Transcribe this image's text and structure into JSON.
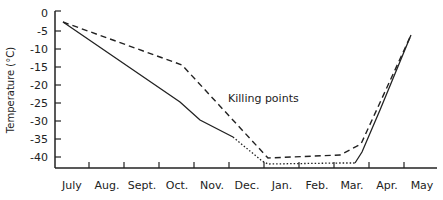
{
  "chart_data": {
    "type": "line",
    "title": "",
    "xlabel": "",
    "ylabel": "Temperature (°C)",
    "ylim": [
      -44,
      0
    ],
    "yticks": [
      0,
      -5,
      -10,
      -15,
      -20,
      -25,
      -30,
      -35,
      -40
    ],
    "categories": [
      "July",
      "Aug.",
      "Sept.",
      "Oct.",
      "Nov.",
      "Dec.",
      "Jan.",
      "Feb.",
      "Mar.",
      "Apr.",
      "May"
    ],
    "annotations": [
      {
        "text": "Killing points",
        "x": "Dec.",
        "y": -23
      }
    ],
    "grid": false,
    "legend": null,
    "series": [
      {
        "name": "Killing points",
        "style": "dashed",
        "points": [
          {
            "x": "July",
            "y": -2.5
          },
          {
            "x": "Oct.",
            "y": -15
          },
          {
            "x": "Jan.",
            "y": -40.5
          },
          {
            "x": "Mar.",
            "y": -39.5
          },
          {
            "x": "mid-Mar.",
            "y": -36.5
          },
          {
            "x": "May",
            "y": -6
          }
        ]
      },
      {
        "name": "Temperature",
        "style": "solid",
        "points": [
          {
            "x": "July",
            "y": -2.5
          },
          {
            "x": "Oct.",
            "y": -25
          },
          {
            "x": "Nov.",
            "y": -30
          },
          {
            "x": "Dec.",
            "y": -34.5
          },
          {
            "x": "Jan.",
            "y": -42
          },
          {
            "x": "Mar.",
            "y": -42
          },
          {
            "x": "May",
            "y": -6
          }
        ],
        "dotted_segment": [
          "Dec.",
          "Mar."
        ]
      }
    ]
  }
}
